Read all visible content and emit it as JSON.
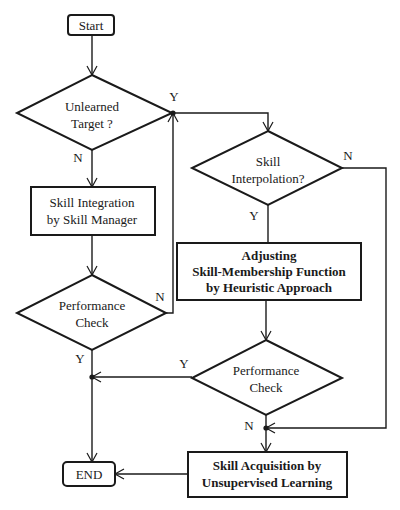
{
  "flowchart": {
    "start": {
      "label": "Start"
    },
    "end": {
      "label": "END"
    },
    "decision_unlearned": {
      "line1": "Unlearned",
      "line2": "Target ?",
      "yes": "Y",
      "no": "N"
    },
    "process_integration": {
      "line1": "Skill Integration",
      "line2": "by Skill Manager"
    },
    "decision_perf1": {
      "line1": "Performance",
      "line2": "Check",
      "yes": "Y",
      "no": "N"
    },
    "decision_interp": {
      "line1": "Skill",
      "line2": "Interpolation?",
      "yes": "Y",
      "no": "N"
    },
    "process_adjust": {
      "line1": "Adjusting",
      "line2": "Skill-Membership Function",
      "line3": "by Heuristic Approach"
    },
    "decision_perf2": {
      "line1": "Performance",
      "line2": "Check",
      "yes": "Y",
      "no": "N"
    },
    "process_acquisition": {
      "line1": "Skill Acquisition by",
      "line2": "Unsupervised Learning"
    }
  },
  "colors": {
    "stroke": "#1a1a1a",
    "background": "#ffffff"
  }
}
